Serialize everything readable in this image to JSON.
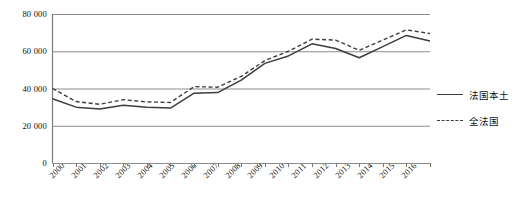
{
  "chart_data": {
    "type": "line",
    "title": "",
    "xlabel": "",
    "ylabel": "",
    "ylim": [
      0,
      80000
    ],
    "yticks": [
      0,
      20000,
      40000,
      60000,
      80000
    ],
    "ytick_labels": [
      "0",
      "20 000",
      "40 000",
      "60 000",
      "80 000"
    ],
    "grid": true,
    "legend_position": "right",
    "categories": [
      "2000",
      "2001",
      "2002",
      "2003",
      "2004",
      "2005",
      "2006",
      "2007",
      "2008",
      "2009",
      "2010",
      "2011",
      "2012",
      "2013",
      "2014",
      "2015",
      "2016"
    ],
    "series": [
      {
        "name": "法国本土",
        "style": "solid",
        "color": "#3d3d3d",
        "values": [
          34500,
          30000,
          29000,
          31000,
          30000,
          29500,
          37500,
          37800,
          44500,
          53500,
          57500,
          64000,
          61500,
          56500,
          62500,
          68500,
          65500
        ]
      },
      {
        "name": "全法国",
        "style": "dashed",
        "color": "#3d3d3d",
        "values": [
          40000,
          33000,
          31500,
          34000,
          32800,
          32500,
          41000,
          40700,
          46500,
          55000,
          60000,
          66500,
          66000,
          60500,
          66000,
          71500,
          69500
        ]
      }
    ]
  },
  "legend": {
    "items": [
      {
        "label": "法国本土",
        "style": "solid"
      },
      {
        "label": "全法国",
        "style": "dashed"
      }
    ]
  }
}
